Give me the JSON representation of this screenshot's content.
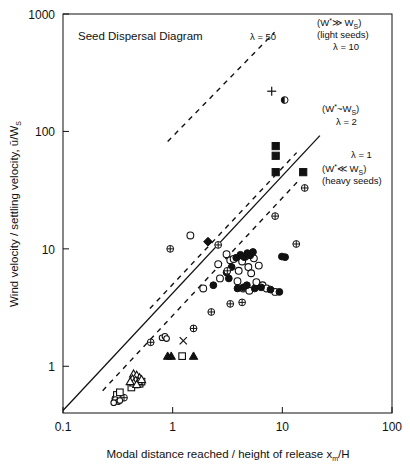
{
  "figure": {
    "title": "Seed Dispersal Diagram",
    "background": "#ffffff",
    "ink": "#111111"
  },
  "axes": {
    "x_label_main": "Modal distance reached / height of release x",
    "x_label_sub": "m",
    "x_label_tail": "/H",
    "y_label_main": "Wind velocity / settling velocity, ū/W",
    "y_label_sub": "S",
    "x_ticks": [
      "0.1",
      "1",
      "10",
      "100"
    ],
    "y_ticks": [
      "1",
      "10",
      "100",
      "1000"
    ]
  },
  "annotations": {
    "lambda50": "λ = 50",
    "lambda10": "λ = 10",
    "lambda2": "λ = 2",
    "lambda1": "λ = 1",
    "light_regime_line1_a": "(W",
    "light_regime_line1_b": "*",
    "light_regime_line1_c": "≫ W",
    "light_regime_line1_d": "S",
    "light_regime_line1_e": ")",
    "light_regime_line2": "(light seeds)",
    "mid_regime_a": "(W",
    "mid_regime_b": "*",
    "mid_regime_c": "~W",
    "mid_regime_d": "S",
    "mid_regime_e": ")",
    "heavy_regime_line1_a": "(W",
    "heavy_regime_line1_b": "*",
    "heavy_regime_line1_c": "≪ W",
    "heavy_regime_line1_d": "S",
    "heavy_regime_line1_e": ")",
    "heavy_regime_line2": "(heavy seeds)"
  },
  "chart_data": {
    "type": "scatter",
    "title": "Seed Dispersal Diagram",
    "xlabel": "Modal distance reached / height of release xm/H",
    "ylabel": "Wind velocity / settling velocity, u/Ws",
    "xscale": "log",
    "yscale": "log",
    "xlim": [
      0.1,
      100
    ],
    "ylim": [
      0.4,
      1000
    ],
    "grid": false,
    "legend": "none",
    "reference_lines": [
      {
        "name": "lambda=1",
        "style": "solid",
        "slope": 1,
        "lambda": 1,
        "x": [
          0.1,
          22
        ],
        "y": [
          0.42,
          92
        ]
      },
      {
        "name": "lambda=2",
        "style": "dashed",
        "slope": 1,
        "lambda": 2,
        "x": [
          0.23,
          14
        ],
        "y": [
          0.62,
          38
        ]
      },
      {
        "name": "lambda=10",
        "style": "dashed",
        "slope": 1,
        "lambda": 10,
        "x": [
          0.62,
          13.5
        ],
        "y": [
          3.1,
          66
        ]
      },
      {
        "name": "lambda=50",
        "style": "dashed",
        "slope": 1,
        "lambda": 50,
        "x": [
          0.9,
          8.5
        ],
        "y": [
          82,
          700
        ]
      }
    ],
    "series": [
      {
        "name": "open-circle",
        "marker": "open circle",
        "points": [
          [
            1.9,
            4.6
          ],
          [
            2.6,
            7.4
          ],
          [
            3.1,
            9.0
          ],
          [
            3.35,
            8.0
          ],
          [
            3.6,
            8.2
          ],
          [
            4.0,
            6.5
          ],
          [
            4.3,
            7.8
          ],
          [
            4.6,
            8.6
          ],
          [
            4.9,
            7.0
          ],
          [
            5.2,
            6.2
          ],
          [
            5.5,
            8.3
          ],
          [
            5.8,
            5.2
          ],
          [
            6.1,
            7.2
          ],
          [
            6.6,
            4.9
          ],
          [
            7.2,
            4.6
          ],
          [
            8.6,
            4.3
          ],
          [
            2.7,
            5.6
          ],
          [
            3.9,
            5.3
          ],
          [
            4.4,
            4.6
          ],
          [
            5.0,
            4.4
          ],
          [
            1.45,
            13.0
          ]
        ]
      },
      {
        "name": "filled-circle",
        "marker": "filled circle",
        "points": [
          [
            2.35,
            4.9
          ],
          [
            3.1,
            6.3
          ],
          [
            3.45,
            7.0
          ],
          [
            3.8,
            8.4
          ],
          [
            4.15,
            8.9
          ],
          [
            4.5,
            8.5
          ],
          [
            4.8,
            9.2
          ],
          [
            5.1,
            8.8
          ],
          [
            5.4,
            9.4
          ],
          [
            3.25,
            5.6
          ],
          [
            3.9,
            4.6
          ],
          [
            4.4,
            4.7
          ],
          [
            4.75,
            4.9
          ],
          [
            5.6,
            4.6
          ],
          [
            6.4,
            4.7
          ],
          [
            7.8,
            4.5
          ],
          [
            9.4,
            4.3
          ],
          [
            9.9,
            8.6
          ],
          [
            10.6,
            8.5
          ]
        ]
      },
      {
        "name": "crossed-circle",
        "marker": "circle with cross",
        "points": [
          [
            0.95,
            10.0
          ],
          [
            2.6,
            10.8
          ],
          [
            3.15,
            6.5
          ],
          [
            3.35,
            3.4
          ],
          [
            4.3,
            3.5
          ],
          [
            2.25,
            2.9
          ],
          [
            1.55,
            2.1
          ],
          [
            0.63,
            1.6
          ],
          [
            0.33,
            0.55
          ],
          [
            0.36,
            0.54
          ],
          [
            0.3,
            0.53
          ],
          [
            13.4,
            11.0
          ],
          [
            16.0,
            33.0
          ],
          [
            8.6,
            19.0
          ]
        ]
      },
      {
        "name": "filled-square",
        "marker": "filled square",
        "points": [
          [
            8.7,
            62.0
          ],
          [
            8.7,
            75.0
          ],
          [
            8.7,
            45.0
          ],
          [
            15.5,
            45.0
          ]
        ]
      },
      {
        "name": "filled-diamond",
        "marker": "filled diamond",
        "points": [
          [
            2.1,
            11.5
          ]
        ]
      },
      {
        "name": "plus",
        "marker": "plus",
        "points": [
          [
            8.0,
            220.0
          ]
        ]
      },
      {
        "name": "half-filled-circle",
        "marker": "half filled circle",
        "points": [
          [
            10.5,
            185.0
          ]
        ]
      },
      {
        "name": "cross-x",
        "marker": "x cross",
        "points": [
          [
            1.25,
            1.65
          ]
        ]
      },
      {
        "name": "filled-triangle",
        "marker": "filled triangle",
        "points": [
          [
            0.9,
            1.22
          ],
          [
            0.97,
            1.22
          ],
          [
            1.55,
            1.22
          ]
        ]
      },
      {
        "name": "open-square",
        "marker": "open square",
        "points": [
          [
            1.22,
            1.22
          ],
          [
            0.5,
            0.71
          ],
          [
            0.46,
            0.7
          ],
          [
            0.52,
            0.74
          ],
          [
            0.42,
            0.66
          ],
          [
            0.31,
            0.57
          ],
          [
            0.33,
            0.6
          ]
        ]
      },
      {
        "name": "open-triangle",
        "marker": "open triangle",
        "points": [
          [
            0.44,
            0.86
          ],
          [
            0.47,
            0.84
          ],
          [
            0.5,
            0.8
          ],
          [
            0.43,
            0.78
          ],
          [
            0.46,
            0.76
          ],
          [
            0.49,
            0.74
          ],
          [
            0.44,
            0.72
          ],
          [
            0.52,
            0.77
          ],
          [
            0.41,
            0.74
          ],
          [
            0.47,
            0.7
          ]
        ]
      },
      {
        "name": "small-open-circle-cluster",
        "marker": "open circle small",
        "points": [
          [
            0.3,
            0.52
          ],
          [
            0.32,
            0.5
          ],
          [
            0.29,
            0.49
          ],
          [
            0.33,
            0.51
          ],
          [
            0.8,
            1.75
          ],
          [
            0.85,
            1.8
          ],
          [
            0.88,
            1.72
          ]
        ]
      }
    ]
  }
}
